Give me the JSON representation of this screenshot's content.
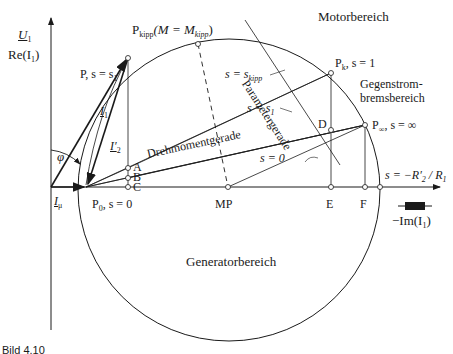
{
  "figure": {
    "caption": "Bild 4.10",
    "axes": {
      "y_label_top": "U",
      "y_label_top_sub": "1",
      "y_label": "Re(I",
      "y_label_sub": "1",
      "x_label": "−Im(I",
      "x_label_sub": "1"
    },
    "points": {
      "P": "P, s = s",
      "P_sub": "1",
      "P_kipp": "P",
      "P_kipp_sub": "kipp",
      "P_kipp_cond": "(M = M",
      "P_kipp_cond_sub": "kipp",
      "P_k": "P",
      "P_k_sub": "k",
      "P_k_cond": ", s = 1",
      "P_inf": "P",
      "P_inf_sub": "∞",
      "P_inf_cond": ", s =  ∞",
      "P0": "P",
      "P0_sub": "0",
      "P0_cond": ", s = 0",
      "MP": "MP",
      "A": "A",
      "B": "B",
      "C": "C",
      "D": "D",
      "E": "E",
      "F": "F"
    },
    "regions": {
      "motor": "Motorbereich",
      "counter_current_1": "Gegenstrom-",
      "counter_current_2": "bremsbereich",
      "generator": "Generatorbereich"
    },
    "lines": {
      "parameter": "Parametergerade",
      "torque": "Drehmomentgerade",
      "s_kipp": "s = s",
      "s_kipp_sub": "kipp",
      "s_1": "s = s",
      "s_1_sub": "1",
      "s_0": "s = 0",
      "s_neg": "s = −R′",
      "s_neg_sub": "2",
      "s_neg_tail": " / R",
      "s_neg_tail_sub": "1"
    },
    "vectors": {
      "I1": "I",
      "I1_sub": "1",
      "I2": "I′",
      "I2_sub": "2",
      "Imu": "I",
      "Imu_sub": "μ",
      "phi": "φ"
    },
    "resistor_symbol": "resistor-icon"
  }
}
